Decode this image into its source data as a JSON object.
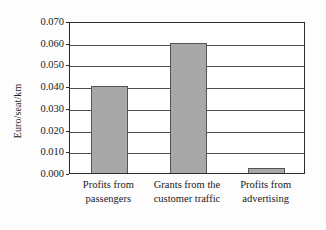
{
  "chart_data": {
    "type": "bar",
    "title": "",
    "subtitle": "",
    "xlabel": "",
    "ylabel": "Euro/seat/km",
    "ylim": [
      0.0,
      0.07
    ],
    "grid": true,
    "legend": "none",
    "categories": [
      "Profits from passengers",
      "Grants from the customer traffic",
      "Profits from advertising"
    ],
    "category_lines": [
      [
        "Profits from",
        "passengers"
      ],
      [
        "Grants from the",
        "customer traffic"
      ],
      [
        "Profits from",
        "advertising"
      ]
    ],
    "values": [
      0.04,
      0.06,
      0.0025
    ],
    "ytick_labels": [
      "0.070",
      "0.060",
      "0.050",
      "0.040",
      "0.030",
      "0.020",
      "0.010",
      "0.000"
    ],
    "ytick_values": [
      0.07,
      0.06,
      0.05,
      0.04,
      0.03,
      0.02,
      0.01,
      0.0
    ],
    "colors": {
      "bar_fill": "#a8a8a8",
      "bar_stroke": "#555555",
      "gridline": "#4d4d4d",
      "frame": "#2b2b2b",
      "background": "#fdfdfd",
      "plot_background": "#ffffff",
      "text": "#1a1a1a"
    }
  }
}
